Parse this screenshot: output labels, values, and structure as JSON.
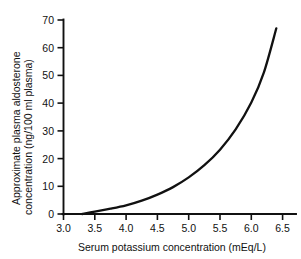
{
  "chart_data": {
    "type": "line",
    "title": "",
    "subtitle": "",
    "xlabel": "Serum potassium concentration (mEq/L)",
    "ylabel": "Approximate plasma aldosterone concentration (ng/100 ml plasma)",
    "ylabel_line1": "Approximate plasma aldosterone",
    "ylabel_line2": "concentration (ng/100 ml plasma)",
    "xlim": [
      3.0,
      6.9
    ],
    "ylim": [
      0,
      70
    ],
    "xticks": [
      3.0,
      3.5,
      4.0,
      4.5,
      5.0,
      5.5,
      6.0,
      6.5
    ],
    "xtick_labels": [
      "3.0",
      "3.5",
      "4.0",
      "4.5",
      "5.0",
      "5.5",
      "6.0",
      "6.5"
    ],
    "yticks": [
      0,
      10,
      20,
      30,
      40,
      50,
      60,
      70
    ],
    "ytick_labels": [
      "0",
      "10",
      "20",
      "30",
      "40",
      "50",
      "60",
      "70"
    ],
    "grid": false,
    "legend": false,
    "legend_position": "none",
    "line_color": "#111111",
    "series": [
      {
        "name": "Plasma aldosterone vs serum potassium",
        "x": [
          3.3,
          3.5,
          3.75,
          4.0,
          4.25,
          4.5,
          4.75,
          5.0,
          5.25,
          5.5,
          5.75,
          6.0,
          6.2,
          6.4
        ],
        "values": [
          0.0,
          0.9,
          1.9,
          3.1,
          4.8,
          7.0,
          9.7,
          13.2,
          17.6,
          23.2,
          30.5,
          40.2,
          51.0,
          67.0
        ]
      }
    ],
    "annotations": []
  },
  "figure": {
    "background_color": "#ffffff",
    "axis_color": "#111111"
  }
}
